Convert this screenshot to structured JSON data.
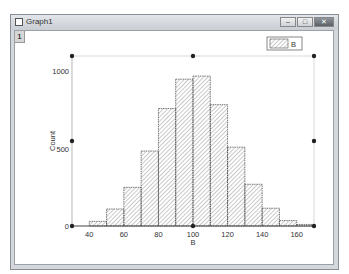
{
  "window": {
    "title": "Graph1",
    "layer_tab": "1",
    "controls": {
      "minimize": "–",
      "maximize": "□",
      "close": "✕"
    }
  },
  "legend": {
    "label": "B"
  },
  "chart_data": {
    "type": "bar",
    "title": "",
    "xlabel": "B",
    "ylabel": "Count",
    "bin_width": 10,
    "bin_starts": [
      40,
      50,
      60,
      70,
      80,
      90,
      100,
      110,
      120,
      130,
      140,
      150,
      160
    ],
    "values": [
      30,
      110,
      250,
      485,
      760,
      950,
      970,
      785,
      510,
      270,
      115,
      35,
      10
    ],
    "xlim": [
      30,
      170
    ],
    "ylim": [
      0,
      1100
    ],
    "xticks": [
      "40",
      "60",
      "80",
      "100",
      "120",
      "140",
      "160"
    ],
    "yticks": [
      "0",
      "500",
      "1000"
    ],
    "legend": [
      "B"
    ],
    "legend_position": "top-right",
    "grid": false,
    "fill": "diagonal-hatch"
  }
}
